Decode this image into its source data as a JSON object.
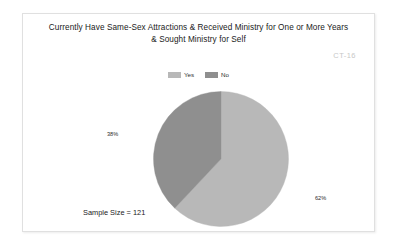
{
  "frame": {
    "border_color": "#e0e0e0",
    "background": "#ffffff"
  },
  "watermark": {
    "text": "CT-16",
    "color": "#c8c8c8"
  },
  "sample_size_note": "Sample Size = 121",
  "chart_data": {
    "type": "pie",
    "title": "Currently Have Same-Sex Attractions & Received Ministry for One or More Years & Sought Ministry for Self",
    "title_lines": [
      "Currently Have Same-Sex Attractions & Received Ministry for One or More Years",
      "& Sought Ministry for Self"
    ],
    "xlabel": "",
    "ylabel": "",
    "legend_position": "top-center",
    "grid": false,
    "start_angle_deg": 0,
    "direction": "clockwise",
    "sample_size": 121,
    "categories": [
      "Yes",
      "No"
    ],
    "values": [
      62,
      38
    ],
    "value_unit": "%",
    "data_labels": [
      "62%",
      "38%"
    ],
    "colors": [
      "#b8b8b8",
      "#8f8f8f"
    ],
    "slices": [
      {
        "name": "Yes",
        "value": 62,
        "label": "62%",
        "color": "#b8b8b8",
        "sweep_deg": 223.2
      },
      {
        "name": "No",
        "value": 38,
        "label": "38%",
        "color": "#8f8f8f",
        "sweep_deg": 136.8
      }
    ],
    "legend": [
      {
        "label": "Yes",
        "color": "#b8b8b8"
      },
      {
        "label": "No",
        "color": "#8f8f8f"
      }
    ]
  }
}
